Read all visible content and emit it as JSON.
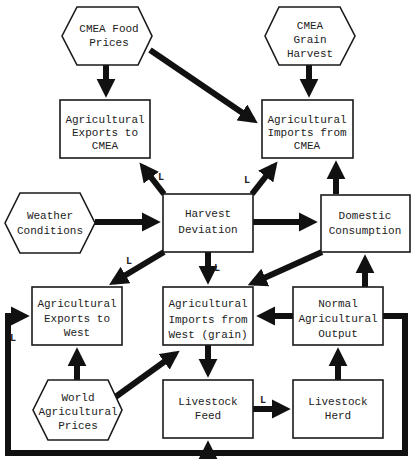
{
  "diagram": {
    "colors": {
      "stroke": "#111111",
      "fill": "#ffffff",
      "text": "#222222"
    },
    "nodes": {
      "cmea_food_prices": {
        "shape": "hexagon",
        "lines": [
          "CMEA Food",
          "Prices"
        ]
      },
      "cmea_grain_harvest": {
        "shape": "hexagon",
        "lines": [
          "CMEA",
          "Grain",
          "Harvest"
        ]
      },
      "ag_exports_cmea": {
        "shape": "rect",
        "lines": [
          "Agricultural",
          "Exports to",
          "CMEA"
        ]
      },
      "ag_imports_cmea": {
        "shape": "rect",
        "lines": [
          "Agricultural",
          "Imports from",
          "CMEA"
        ]
      },
      "weather_conditions": {
        "shape": "hexagon",
        "lines": [
          "Weather",
          "Conditions"
        ]
      },
      "harvest_deviation": {
        "shape": "rect",
        "lines": [
          "Harvest",
          "Deviation"
        ]
      },
      "domestic_consumption": {
        "shape": "rect",
        "lines": [
          "Domestic",
          "Consumption"
        ]
      },
      "ag_exports_west": {
        "shape": "rect",
        "lines": [
          "Agricultural",
          "Exports to",
          "West"
        ]
      },
      "ag_imports_west": {
        "shape": "rect",
        "lines": [
          "Agricultural",
          "Imports from",
          "West (grain)"
        ]
      },
      "normal_ag_output": {
        "shape": "rect",
        "lines": [
          "Normal",
          "Agricultural",
          "Output"
        ]
      },
      "world_ag_prices": {
        "shape": "hexagon",
        "lines": [
          "World",
          "Agricultural",
          "Prices"
        ]
      },
      "livestock_feed": {
        "shape": "rect",
        "lines": [
          "Livestock",
          "Feed"
        ]
      },
      "livestock_herd": {
        "shape": "rect",
        "lines": [
          "Livestock",
          "Herd"
        ]
      }
    },
    "edges": [
      {
        "from": "cmea_food_prices",
        "to": "ag_exports_cmea",
        "label": ""
      },
      {
        "from": "cmea_food_prices",
        "to": "ag_imports_cmea",
        "label": ""
      },
      {
        "from": "cmea_grain_harvest",
        "to": "ag_imports_cmea",
        "label": ""
      },
      {
        "from": "harvest_deviation",
        "to": "ag_exports_cmea",
        "label": "L"
      },
      {
        "from": "harvest_deviation",
        "to": "ag_imports_cmea",
        "label": "L"
      },
      {
        "from": "weather_conditions",
        "to": "harvest_deviation",
        "label": ""
      },
      {
        "from": "harvest_deviation",
        "to": "domestic_consumption",
        "label": ""
      },
      {
        "from": "domestic_consumption",
        "to": "ag_imports_cmea",
        "label": ""
      },
      {
        "from": "harvest_deviation",
        "to": "ag_exports_west",
        "label": "L"
      },
      {
        "from": "harvest_deviation",
        "to": "ag_imports_west",
        "label": "L"
      },
      {
        "from": "domestic_consumption",
        "to": "ag_imports_west",
        "label": ""
      },
      {
        "from": "normal_ag_output",
        "to": "ag_imports_west",
        "label": ""
      },
      {
        "from": "normal_ag_output",
        "to": "domestic_consumption",
        "label": ""
      },
      {
        "from": "world_ag_prices",
        "to": "ag_exports_west",
        "label": ""
      },
      {
        "from": "world_ag_prices",
        "to": "ag_imports_west",
        "label": ""
      },
      {
        "from": "ag_imports_west",
        "to": "livestock_feed",
        "label": ""
      },
      {
        "from": "livestock_feed",
        "to": "livestock_herd",
        "label": "L"
      },
      {
        "from": "livestock_herd",
        "to": "normal_ag_output",
        "label": ""
      },
      {
        "from": "normal_ag_output",
        "to": "ag_exports_west",
        "label": "L"
      },
      {
        "from": "normal_ag_output",
        "to": "livestock_feed",
        "label": ""
      }
    ],
    "labels": {
      "lag": "L"
    }
  }
}
